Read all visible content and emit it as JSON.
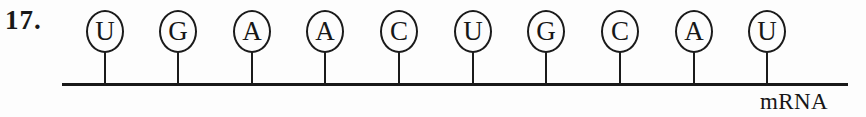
{
  "figure": {
    "question_number": "17.",
    "strand_label": "mRNA",
    "stroke_color": "#1b1b1b",
    "background_color": "#fdfdfd",
    "text_color": "#171717"
  },
  "sequence": {
    "molecule": "mRNA",
    "length": 10,
    "bases": [
      {
        "letter": "U",
        "index": 1,
        "x": 84
      },
      {
        "letter": "G",
        "index": 2,
        "x": 157
      },
      {
        "letter": "A",
        "index": 3,
        "x": 231
      },
      {
        "letter": "A",
        "index": 4,
        "x": 304
      },
      {
        "letter": "C",
        "index": 5,
        "x": 378
      },
      {
        "letter": "U",
        "index": 6,
        "x": 452
      },
      {
        "letter": "G",
        "index": 7,
        "x": 525
      },
      {
        "letter": "C",
        "index": 8,
        "x": 599
      },
      {
        "letter": "A",
        "index": 9,
        "x": 673
      },
      {
        "letter": "U",
        "index": 10,
        "x": 746
      }
    ]
  }
}
